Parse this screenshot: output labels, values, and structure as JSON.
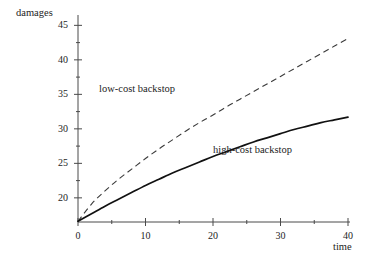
{
  "chart_data": {
    "type": "line",
    "title": "",
    "xlabel": "time",
    "ylabel": "damages",
    "xlim": [
      0,
      40
    ],
    "ylim": [
      16.5,
      46.5
    ],
    "grid": false,
    "legend_position": "inline-annotation",
    "x_ticks_major": [
      0,
      10,
      20,
      30,
      40
    ],
    "x_ticks_minor": [
      5,
      15,
      25,
      35
    ],
    "y_ticks_major": [
      20,
      25,
      30,
      35,
      40,
      45
    ],
    "y_ticks_minor": [
      22.5,
      27.5,
      32.5,
      37.5,
      42.5
    ],
    "x_tick_labels": [
      "0",
      "10",
      "20",
      "30",
      "40"
    ],
    "y_tick_labels": [
      "20",
      "25",
      "30",
      "35",
      "40",
      "45"
    ],
    "series": [
      {
        "name": "low-cost backstop",
        "style": "dashed",
        "color": "#3a3a3a",
        "x": [
          0,
          2,
          4,
          6,
          8,
          10,
          12,
          14,
          16,
          18,
          20,
          22,
          24,
          26,
          28,
          30,
          32,
          34,
          36,
          38,
          40
        ],
        "values": [
          16.6,
          19.1,
          21.0,
          22.7,
          24.2,
          25.7,
          27.1,
          28.4,
          29.7,
          30.9,
          32.0,
          33.2,
          34.3,
          35.4,
          36.5,
          37.6,
          38.7,
          39.8,
          40.9,
          42.0,
          43.1
        ]
      },
      {
        "name": "high-cost backstop",
        "style": "solid",
        "color": "#111111",
        "x": [
          0,
          2,
          4,
          6,
          8,
          10,
          12,
          14,
          16,
          18,
          20,
          22,
          24,
          26,
          28,
          30,
          32,
          34,
          36,
          38,
          40
        ],
        "values": [
          16.6,
          17.7,
          18.8,
          19.8,
          20.8,
          21.8,
          22.7,
          23.6,
          24.4,
          25.2,
          26.0,
          26.7,
          27.4,
          28.1,
          28.7,
          29.3,
          29.9,
          30.4,
          30.9,
          31.3,
          31.7
        ]
      }
    ],
    "annotations": [
      {
        "text": "low-cost backstop",
        "x_value": 8,
        "y_value": 35.5
      },
      {
        "text": "high-cost backstop",
        "x_value": 24,
        "y_value": 26.5
      }
    ]
  },
  "labels": {
    "y_axis_title": "damages",
    "x_axis_title": "time",
    "low_cost": "low-cost backstop",
    "high_cost": "high-cost backstop"
  },
  "colors": {
    "background": "#ffffff",
    "axis": "#4a4a4a",
    "solid_curve": "#111111",
    "dashed_curve": "#3a3a3a",
    "text": "#1d1d1d"
  }
}
